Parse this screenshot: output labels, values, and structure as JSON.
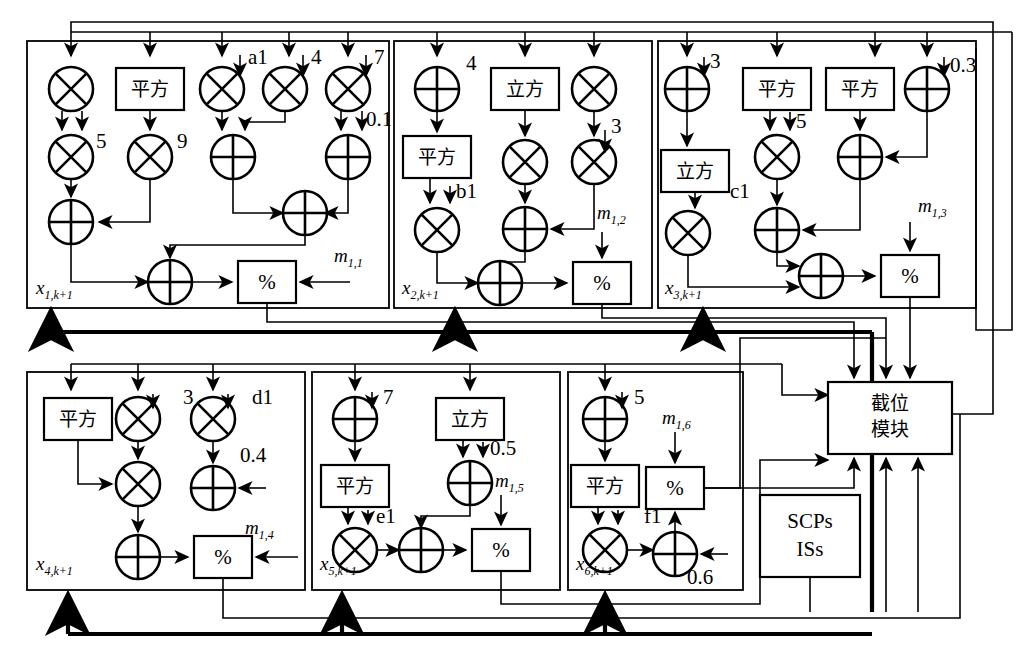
{
  "diagram": {
    "language_note": "Chinese operator boxes",
    "ops": {
      "square_label": "平方",
      "cube_label": "立方",
      "mod_label": "%",
      "multiply_icon": "circle-times",
      "add_icon": "circle-plus"
    },
    "blocks": [
      {
        "id": "x1",
        "state_label": "x",
        "state_sub": "1,k+1",
        "mod_input_label": "m",
        "mod_input_sub": "1,1",
        "constants": [
          "a1",
          "4",
          "7",
          "5",
          "9",
          "0.1"
        ],
        "op_boxes": [
          "平方"
        ]
      },
      {
        "id": "x2",
        "state_label": "x",
        "state_sub": "2,k+1",
        "mod_input_label": "m",
        "mod_input_sub": "1,2",
        "constants": [
          "4",
          "b1",
          "3"
        ],
        "op_boxes": [
          "立方",
          "平方"
        ]
      },
      {
        "id": "x3",
        "state_label": "x",
        "state_sub": "3,k+1",
        "mod_input_label": "m",
        "mod_input_sub": "1,3",
        "constants": [
          "3",
          "0.3",
          "5",
          "c1"
        ],
        "op_boxes": [
          "平方",
          "平方",
          "立方"
        ]
      },
      {
        "id": "x4",
        "state_label": "x",
        "state_sub": "4,k+1",
        "mod_input_label": "m",
        "mod_input_sub": "1,4",
        "constants": [
          "3",
          "d1",
          "0.4"
        ],
        "op_boxes": [
          "平方"
        ]
      },
      {
        "id": "x5",
        "state_label": "x",
        "state_sub": "5,k+1",
        "mod_input_label": "m",
        "mod_input_sub": "1,5",
        "constants": [
          "7",
          "0.5",
          "e1"
        ],
        "op_boxes": [
          "立方",
          "平方"
        ]
      },
      {
        "id": "x6",
        "state_label": "x",
        "state_sub": "6,k+1",
        "mod_input_label": "m",
        "mod_input_sub": "1,6",
        "constants": [
          "5",
          "f1",
          "0.6"
        ],
        "op_boxes": [
          "平方"
        ]
      }
    ],
    "modules": [
      {
        "id": "truncate",
        "line1": "截位",
        "line2": "模块"
      },
      {
        "id": "scps",
        "line1": "SCPs",
        "line2": "ISs"
      }
    ],
    "colors": {
      "stroke": "#000000",
      "background": "#ffffff"
    }
  }
}
